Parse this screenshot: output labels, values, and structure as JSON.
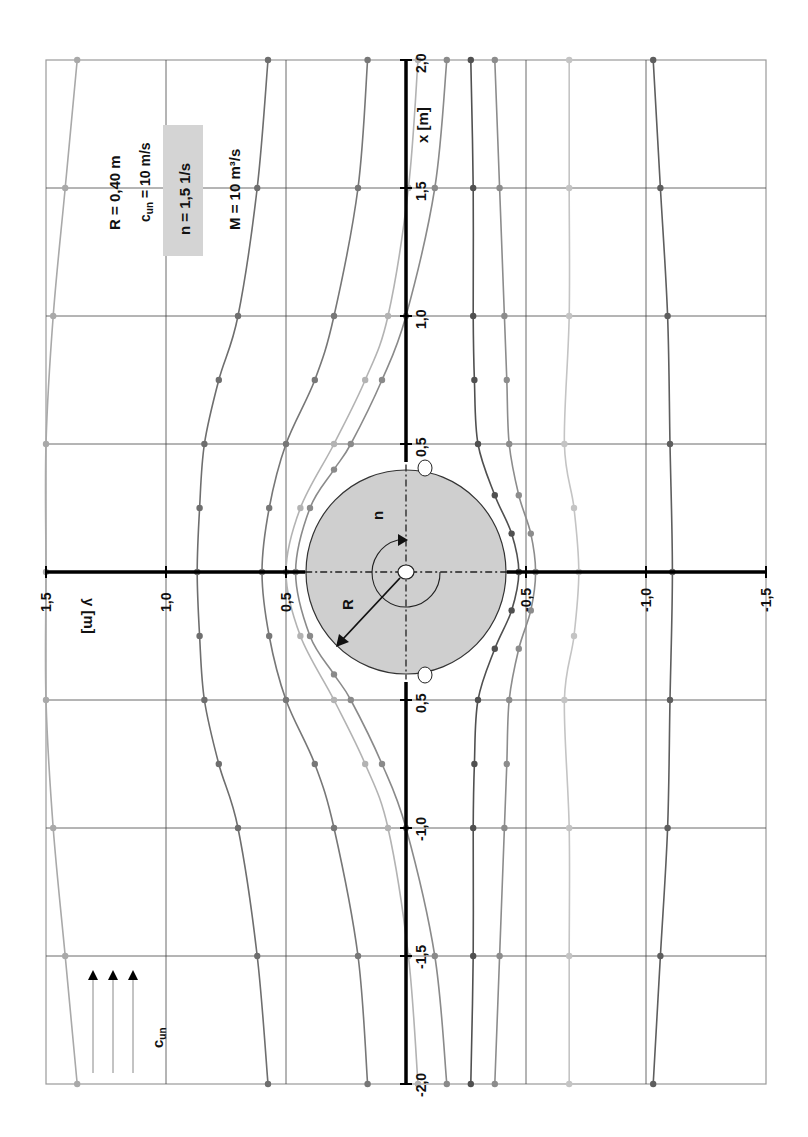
{
  "parameters": {
    "R": "R = 0,40  m",
    "cun_main": "c",
    "cun_sub": "un",
    "cun_rest": " = 10 m/s",
    "n": "n = 1,5  1/s",
    "M": "M = 10 m³/s"
  },
  "axes": {
    "x_label": "x  [m]",
    "y_label": "y  [m]",
    "x_ticks": [
      "2,0",
      "1,5",
      "1,0",
      "0,5",
      "0,5",
      "-1,0",
      "-1,5",
      "-2,0"
    ],
    "x_tick_values": [
      2.0,
      1.5,
      1.0,
      0.5,
      -0.5,
      -1.0,
      -1.5,
      -2.0
    ],
    "y_ticks": [
      "1,5",
      "1,0",
      "0,5",
      "-0,5",
      "-1,0",
      "-1,5"
    ],
    "y_tick_values": [
      1.5,
      1.0,
      0.5,
      -0.5,
      -1.0,
      -1.5
    ]
  },
  "cylinder": {
    "radius_label": "R",
    "rotation_label": "n",
    "fill": "#cfcfcf"
  },
  "flow_label_main": "c",
  "flow_label_sub": "un",
  "chart_data": {
    "type": "line",
    "title": "",
    "xlabel": "x [m]",
    "ylabel": "y [m]",
    "xlim": [
      -2.0,
      2.0
    ],
    "ylim": [
      -1.5,
      1.5
    ],
    "grid": true,
    "orientation": "rotated 90° (x vertical, y horizontal)",
    "annotations": [
      "R = 0,40 m",
      "cun = 10 m/s",
      "n = 1,5 1/s",
      "M = 10 m³/s"
    ],
    "cylinder_radius": 0.4,
    "stagnation_points": [
      [
        0.42,
        -0.1
      ],
      [
        -0.42,
        -0.1
      ]
    ],
    "series": [
      {
        "name": "streamline-1",
        "color": "#a9a9a9",
        "x": [
          2.0,
          1.5,
          1.0,
          0.5,
          0,
          -0.5,
          -1.0,
          -1.5,
          -2.0
        ],
        "y": [
          1.37,
          1.42,
          1.47,
          1.5,
          1.5,
          1.5,
          1.47,
          1.42,
          1.37
        ]
      },
      {
        "name": "streamline-2",
        "color": "#6e6e6e",
        "x": [
          2.0,
          1.5,
          1.0,
          0.75,
          0.5,
          0.25,
          0,
          -0.25,
          -0.5,
          -0.75,
          -1.0,
          -1.5,
          -2.0
        ],
        "y": [
          0.575,
          0.62,
          0.7,
          0.78,
          0.84,
          0.86,
          0.87,
          0.86,
          0.84,
          0.78,
          0.7,
          0.62,
          0.575
        ]
      },
      {
        "name": "streamline-3",
        "color": "#777777",
        "x": [
          2.0,
          1.5,
          1.0,
          0.75,
          0.5,
          0.25,
          0,
          -0.25,
          -0.5,
          -0.75,
          -1.0,
          -1.5,
          -2.0
        ],
        "y": [
          0.16,
          0.2,
          0.3,
          0.38,
          0.5,
          0.57,
          0.6,
          0.57,
          0.5,
          0.38,
          0.3,
          0.2,
          0.16
        ]
      },
      {
        "name": "streamline-4",
        "color": "#b3b3b3",
        "x": [
          2.0,
          1.5,
          1.0,
          0.75,
          0.5,
          0.25,
          0,
          -0.25,
          -0.5,
          -0.75,
          -1.0,
          -1.5,
          -2.0
        ],
        "y": [
          -0.05,
          -0.01,
          0.075,
          0.17,
          0.3,
          0.44,
          0.5,
          0.44,
          0.3,
          0.17,
          0.075,
          -0.01,
          -0.05
        ]
      },
      {
        "name": "streamline-5",
        "color": "#8a8a8a",
        "x": [
          2.0,
          1.5,
          1.0,
          0.75,
          0.5,
          0.4,
          0.25,
          0,
          -0.25,
          -0.4,
          -0.5,
          -0.75,
          -1.0,
          -1.5,
          -2.0
        ],
        "y": [
          -0.17,
          -0.12,
          0.0,
          0.1,
          0.23,
          0.3,
          0.4,
          0.46,
          0.4,
          0.3,
          0.23,
          0.1,
          0.0,
          -0.12,
          -0.17
        ]
      },
      {
        "name": "streamline-6",
        "color": "#505050",
        "x": [
          2.0,
          1.5,
          1.0,
          0.75,
          0.5,
          0.3,
          0.15,
          0,
          -0.15,
          -0.3,
          -0.5,
          -0.75,
          -1.0,
          -1.5,
          -2.0
        ],
        "y": [
          -0.27,
          -0.28,
          -0.28,
          -0.285,
          -0.3,
          -0.37,
          -0.44,
          -0.47,
          -0.44,
          -0.37,
          -0.3,
          -0.285,
          -0.28,
          -0.28,
          -0.27
        ]
      },
      {
        "name": "streamline-7",
        "color": "#8c8c8c",
        "x": [
          2.0,
          1.5,
          1.0,
          0.75,
          0.5,
          0.3,
          0.15,
          0,
          -0.15,
          -0.3,
          -0.5,
          -0.75,
          -1.0,
          -1.5,
          -2.0
        ],
        "y": [
          -0.37,
          -0.39,
          -0.41,
          -0.42,
          -0.43,
          -0.47,
          -0.52,
          -0.54,
          -0.52,
          -0.47,
          -0.43,
          -0.42,
          -0.41,
          -0.39,
          -0.37
        ]
      },
      {
        "name": "streamline-8",
        "color": "#c4c4c4",
        "x": [
          2.0,
          1.5,
          1.0,
          0.5,
          0.25,
          0,
          -0.25,
          -0.5,
          -1.0,
          -1.5,
          -2.0
        ],
        "y": [
          -0.68,
          -0.68,
          -0.68,
          -0.66,
          -0.7,
          -0.72,
          -0.7,
          -0.66,
          -0.68,
          -0.68,
          -0.68
        ]
      },
      {
        "name": "streamline-9",
        "color": "#5e5e5e",
        "x": [
          2.0,
          1.5,
          1.0,
          0.5,
          0,
          -0.5,
          -1.0,
          -1.5,
          -2.0
        ],
        "y": [
          -1.03,
          -1.06,
          -1.09,
          -1.1,
          -1.11,
          -1.1,
          -1.09,
          -1.06,
          -1.03
        ]
      }
    ]
  }
}
